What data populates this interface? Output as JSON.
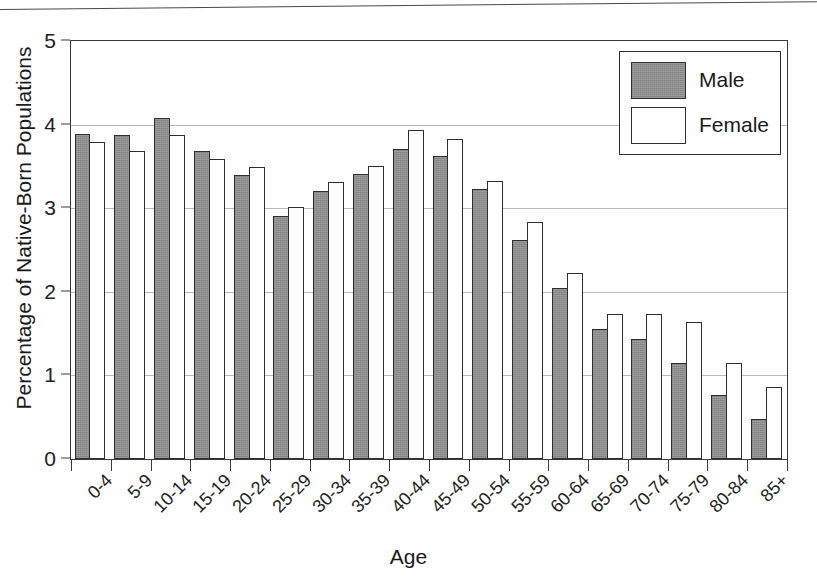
{
  "page": {
    "top_rule": "horizontal-rule"
  },
  "chart_data": {
    "type": "bar",
    "title": "",
    "xlabel": "Age",
    "ylabel": "Percentage of Native-Born Populations",
    "ylim": [
      0,
      5
    ],
    "yticks": [
      0,
      1,
      2,
      3,
      4,
      5
    ],
    "grid": true,
    "legend_position": "top-right",
    "categories": [
      "0-4",
      "5-9",
      "10-14",
      "15-19",
      "20-24",
      "25-29",
      "30-34",
      "35-39",
      "40-44",
      "45-49",
      "50-54",
      "55-59",
      "60-64",
      "65-69",
      "70-74",
      "75-79",
      "80-84",
      "85+"
    ],
    "series": [
      {
        "name": "Male",
        "color": "#8c8c8c",
        "values": [
          3.89,
          3.88,
          4.08,
          3.68,
          3.4,
          2.91,
          3.21,
          3.41,
          3.71,
          3.62,
          3.23,
          2.62,
          2.04,
          1.55,
          1.44,
          1.15,
          0.77,
          0.48
        ]
      },
      {
        "name": "Female",
        "color": "#ffffff",
        "values": [
          3.79,
          3.68,
          3.88,
          3.59,
          3.49,
          3.02,
          3.31,
          3.51,
          3.93,
          3.83,
          3.33,
          2.83,
          2.23,
          1.73,
          1.74,
          1.64,
          1.15,
          0.86
        ]
      }
    ]
  },
  "legend": {
    "items": [
      {
        "label": "Male"
      },
      {
        "label": "Female"
      }
    ]
  }
}
